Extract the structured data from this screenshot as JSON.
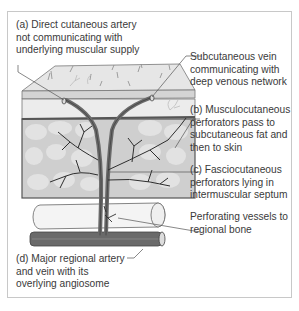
{
  "figure": {
    "colors": {
      "frame_border": "#c8c8c8",
      "skin_surface": "#e6e6e6",
      "dermis_band": "#d4d4d4",
      "fat_layer": "#ececec",
      "muscle_fill": "#cfcfcf",
      "muscle_cells": "#e2e2e2",
      "vessel": "#6a6a6a",
      "branch": "#2e2e2e",
      "bone_fill": "#f4f4f4",
      "text": "#3a3a3a"
    },
    "labels": {
      "a": {
        "lines": [
          "(a) Direct cutaneous artery",
          "not communicating with",
          "underlying muscular supply"
        ]
      },
      "vein": {
        "lines": [
          "Subcutaneous vein",
          "communicating with",
          "deep venous network"
        ]
      },
      "b": {
        "lines": [
          "(b) Musculocutaneous",
          "perforators pass to",
          "subcutaneous fat and",
          "then to skin"
        ]
      },
      "c": {
        "lines": [
          "(c) Fasciocutaneous",
          "perforators lying in",
          "intermuscular septum"
        ]
      },
      "bone": {
        "lines": [
          "Perforating vessels to",
          "regional bone"
        ]
      },
      "d": {
        "lines": [
          "(d) Major regional artery",
          "and vein with its",
          "overlying angiosome"
        ]
      }
    }
  }
}
